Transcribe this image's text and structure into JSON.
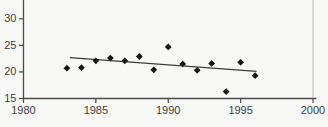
{
  "chart_data": {
    "type": "scatter",
    "title": "",
    "xlabel": "",
    "ylabel": "",
    "series": [
      {
        "name": "observations",
        "marker": "diamond",
        "x": [
          1983,
          1984,
          1985,
          1986,
          1987,
          1988,
          1989,
          1990,
          1991,
          1992,
          1993,
          1994,
          1995,
          1996
        ],
        "y": [
          20.7,
          20.8,
          22.1,
          22.6,
          22.1,
          22.9,
          20.4,
          24.7,
          21.5,
          20.3,
          21.6,
          16.3,
          21.8,
          19.3
        ]
      }
    ],
    "trendline": {
      "x1": 1983.2,
      "y1": 22.7,
      "x2": 1996.1,
      "y2": 20.1
    },
    "xlim": [
      1980,
      2000
    ],
    "ylim_visible": [
      15,
      33.5
    ],
    "x_ticks": [
      "1980",
      "1985",
      "1990",
      "1995",
      "2000"
    ],
    "y_ticks": [
      "15",
      "20",
      "25",
      "30"
    ],
    "grid": false,
    "legend": false,
    "layout": "y-axis cropped at top above the 30 tick",
    "colors": {
      "marker": "#161616",
      "trend_line": "#3c3c3c",
      "axis": "#4a4a4a",
      "right_border": "#bcbcba",
      "tick_label": "#3d3d3d",
      "background": "#f8f8f6"
    }
  }
}
